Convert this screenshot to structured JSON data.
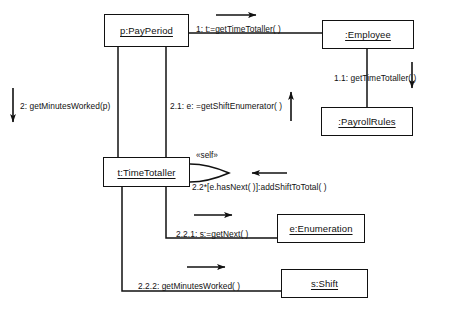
{
  "diagram": {
    "type": "uml-communication-diagram",
    "title": "",
    "objects": [
      {
        "id": "payperiod",
        "label": "p:PayPeriod",
        "x": 104,
        "y": 14,
        "w": 85,
        "h": 33
      },
      {
        "id": "employee",
        "label": ":Employee",
        "x": 322,
        "y": 20,
        "w": 92,
        "h": 29
      },
      {
        "id": "payrollrules",
        "label": ":PayrollRules",
        "x": 321,
        "y": 107,
        "w": 92,
        "h": 29
      },
      {
        "id": "timetotaller",
        "label": "t:TimeTotaller",
        "x": 103,
        "y": 157,
        "w": 87,
        "h": 30
      },
      {
        "id": "enumeration",
        "label": "e:Enumeration",
        "x": 277,
        "y": 214,
        "w": 88,
        "h": 29
      },
      {
        "id": "shift",
        "label": "s:Shift",
        "x": 281,
        "y": 269,
        "w": 87,
        "h": 29
      }
    ],
    "messages": [
      {
        "id": "m1",
        "text": "1: t:=getTimeTotaller( )",
        "x": 196,
        "y": 24,
        "direction": "right",
        "from": "payperiod",
        "to": "employee"
      },
      {
        "id": "m11",
        "text": "1.1: getTimeTotaller( )",
        "x": 334,
        "y": 73,
        "direction": "down",
        "from": "employee",
        "to": "payrollrules"
      },
      {
        "id": "m2",
        "text": "2: getMinutesWorked(p)",
        "x": 20,
        "y": 101,
        "direction": "down",
        "from": "external",
        "to": "payperiod"
      },
      {
        "id": "m21",
        "text": "2.1: e: =getShiftEnumerator( )",
        "x": 170,
        "y": 101,
        "direction": "up",
        "from": "timetotaller",
        "to": "payperiod"
      },
      {
        "id": "m22",
        "text": "2.2*[e.hasNext( )]:addShiftToTotal( )",
        "x": 192,
        "y": 182,
        "direction": "left",
        "from": "timetotaller",
        "to": "timetotaller"
      },
      {
        "id": "m221",
        "text": "2.2.1: s:=getNext( )",
        "x": 176,
        "y": 229,
        "direction": "right",
        "from": "timetotaller",
        "to": "enumeration"
      },
      {
        "id": "m222",
        "text": "2.2.2: getMinutesWorked( )",
        "x": 138,
        "y": 281,
        "direction": "right",
        "from": "timetotaller",
        "to": "shift"
      }
    ],
    "stereotypes": [
      {
        "id": "self",
        "text": "«self»",
        "x": 196,
        "y": 151
      }
    ],
    "colors": {
      "stroke": "#111111",
      "background": "#ffffff",
      "text": "#111111"
    }
  }
}
